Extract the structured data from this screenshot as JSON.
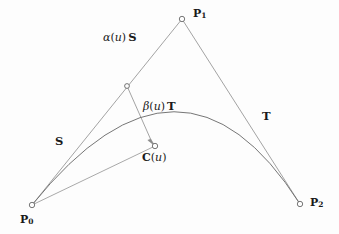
{
  "figure": {
    "background_color": "#fdfdfd",
    "line_color": "#8c8c8c",
    "curve_color": "#6f6f6f",
    "text_color": "#1a1a1a",
    "width": 339,
    "height": 234
  },
  "labels": {
    "p0": "P",
    "p0_sub": "0",
    "p1": "P",
    "p1_sub": "1",
    "p2": "P",
    "p2_sub": "2",
    "s_vector": "S",
    "t_vector": "T",
    "alpha_greek": "α",
    "alpha_open": "(",
    "alpha_u": "u",
    "alpha_close": ")",
    "alpha_vector": "S",
    "beta_greek": "β",
    "beta_open": "(",
    "beta_u": "u",
    "beta_close": ")",
    "beta_vector": "T",
    "c_of_u_name": "C",
    "c_of_u_open": "(",
    "c_of_u_arg": "u",
    "c_of_u_close": ")"
  },
  "geometry": {
    "points": {
      "P0": {
        "x": 32,
        "y": 205
      },
      "P1": {
        "x": 182,
        "y": 19
      },
      "P2": {
        "x": 300,
        "y": 204
      },
      "Cu": {
        "x": 155,
        "y": 146
      },
      "Au": {
        "x": 127,
        "y": 86
      }
    },
    "marker_radius": 2.6,
    "curve": {
      "start": {
        "x": 32,
        "y": 205
      },
      "control": {
        "x": 182,
        "y": 19
      },
      "end": {
        "x": 300,
        "y": 204
      }
    },
    "segments": [
      {
        "name": "P0-P1",
        "from": "P0",
        "to": "P1"
      },
      {
        "name": "P1-P2",
        "from": "P1",
        "to": "P2"
      },
      {
        "name": "Au-Cu",
        "from": "Au",
        "to": "Cu"
      },
      {
        "name": "P0-Cu",
        "from": "P0",
        "to": "Cu"
      }
    ],
    "label_positions": {
      "alpha_expr": {
        "x": 103,
        "y": 31
      },
      "beta_expr": {
        "x": 143,
        "y": 100
      },
      "s_vector": {
        "x": 55,
        "y": 136
      },
      "t_vector": {
        "x": 262,
        "y": 110
      },
      "c_of_u": {
        "x": 142,
        "y": 151
      },
      "p0": {
        "x": 20,
        "y": 214
      },
      "p1": {
        "x": 193,
        "y": 9
      },
      "p2": {
        "x": 310,
        "y": 196
      }
    }
  }
}
